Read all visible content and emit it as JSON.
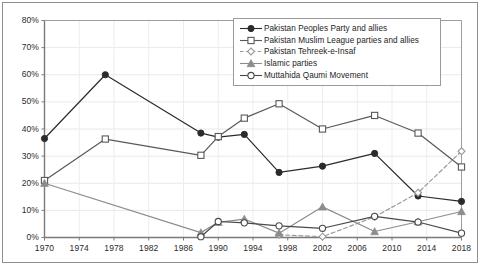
{
  "chart_data": {
    "type": "line",
    "title": "",
    "xlabel": "",
    "ylabel": "",
    "x": [
      1970,
      1977,
      1988,
      1990,
      1993,
      1997,
      2002,
      2008,
      2013,
      2018
    ],
    "xlim": [
      1970,
      2018
    ],
    "ylim": [
      0,
      80
    ],
    "yticks": [
      0,
      10,
      20,
      30,
      40,
      50,
      60,
      70,
      80
    ],
    "ytick_labels": [
      "0%",
      "10%",
      "20%",
      "30%",
      "40%",
      "50%",
      "60%",
      "70%",
      "80%"
    ],
    "xticks": [
      1970,
      1974,
      1978,
      1982,
      1986,
      1990,
      1994,
      1998,
      2002,
      2006,
      2010,
      2014,
      2018
    ],
    "xtick_labels": [
      "1970",
      "1974",
      "1978",
      "1982",
      "1986",
      "1990",
      "1994",
      "1998",
      "2002",
      "2006",
      "2010",
      "2014",
      "2018"
    ],
    "grid": true,
    "legend_position": "top-right",
    "series": [
      {
        "name": "Pakistan Peoples Party and allies",
        "marker": "filled-circle",
        "line": "solid",
        "color": "#2b2b2b",
        "x": [
          1970,
          1977,
          1988,
          1990,
          1993,
          1997,
          2002,
          2008,
          2013,
          2018
        ],
        "values": [
          36.5,
          60.0,
          38.5,
          37.0,
          38.0,
          24.0,
          26.3,
          31.0,
          15.3,
          13.3
        ]
      },
      {
        "name": "Pakistan Muslim League parties and allies",
        "marker": "open-square",
        "line": "solid",
        "color": "#595959",
        "x": [
          1970,
          1977,
          1988,
          1990,
          1993,
          1997,
          2002,
          2008,
          2013,
          2018
        ],
        "values": [
          21.0,
          36.3,
          30.3,
          37.2,
          44.0,
          49.3,
          40.0,
          45.0,
          38.5,
          26.0
        ]
      },
      {
        "name": "Pakistan Tehreek-e-Insaf",
        "marker": "open-diamond",
        "line": "dashed",
        "color": "#9a9a9a",
        "x": [
          1997,
          2002,
          2008,
          2013,
          2018
        ],
        "values": [
          1.0,
          0.3,
          7.6,
          16.5,
          31.8
        ]
      },
      {
        "name": "Islamic parties",
        "marker": "filled-triangle",
        "line": "solid",
        "color": "#8c8c8c",
        "x": [
          1970,
          1988,
          1990,
          1993,
          1997,
          2002,
          2008,
          2013,
          2018
        ],
        "values": [
          20.0,
          1.8,
          5.6,
          6.8,
          1.6,
          11.3,
          2.2,
          5.8,
          9.6
        ]
      },
      {
        "name": "Muttahida Qaumi Movement",
        "marker": "open-circle",
        "line": "solid",
        "color": "#4a4a4a",
        "x": [
          1988,
          1990,
          1993,
          1997,
          2002,
          2008,
          2013,
          2018
        ],
        "values": [
          0.3,
          5.9,
          5.4,
          4.3,
          3.4,
          7.8,
          5.7,
          1.6
        ]
      }
    ]
  }
}
